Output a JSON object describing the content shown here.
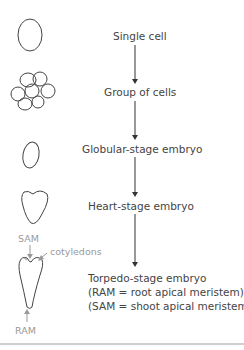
{
  "stages": [
    {
      "label": "Single cell"
    },
    {
      "label": "Group of cells"
    },
    {
      "label": "Globular-stage embryo"
    },
    {
      "label": "Heart-stage embryo"
    },
    {
      "label": "Torpedo-stage embryo"
    }
  ],
  "notes": {
    "ram": "(RAM = root apical meristem)",
    "sam": "(SAM = shoot apical meristem)"
  },
  "annotations": {
    "sam": "SAM",
    "cotyledons": "cotyledons",
    "ram": "RAM"
  },
  "colors": {
    "line": "#333333",
    "annotation": "#9a9a9a"
  }
}
